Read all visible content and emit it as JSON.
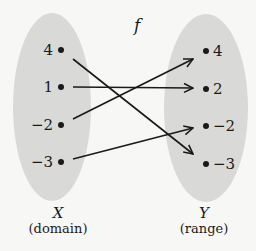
{
  "function_label": "f",
  "colors": {
    "background": "#f7f7f5",
    "ellipse_fill": "#d9d9d7",
    "ink": "#1a1a1a"
  },
  "domain": {
    "set_name": "X",
    "caption": "(domain)",
    "elements": [
      "4",
      "1",
      "−2",
      "−3"
    ]
  },
  "range": {
    "set_name": "Y",
    "caption": "(range)",
    "elements": [
      "4",
      "2",
      "−2",
      "−3"
    ]
  },
  "mappings": [
    {
      "from": "4",
      "to": "−3"
    },
    {
      "from": "1",
      "to": "2"
    },
    {
      "from": "−2",
      "to": "4"
    },
    {
      "from": "−3",
      "to": "−2"
    }
  ]
}
